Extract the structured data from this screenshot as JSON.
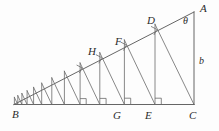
{
  "figure": {
    "background_color": "#fdfdfd",
    "stroke_color": "#555555",
    "label_color": "#2b2b2b",
    "width": 219,
    "height": 131,
    "labels": {
      "apex_left": "B",
      "right_angle_corner": "C",
      "top_right": "A",
      "angle": "θ",
      "vertical_side": "b",
      "foot_e": "E",
      "foot_g": "G",
      "point_d": "D",
      "point_f": "F",
      "point_h": "H"
    },
    "label_positions": {
      "apex_left": {
        "x": 12,
        "y": 109
      },
      "right_angle_corner": {
        "x": 189,
        "y": 110
      },
      "top_right": {
        "x": 200,
        "y": 3
      },
      "angle": {
        "x": 183,
        "y": 16
      },
      "vertical_side": {
        "x": 199,
        "y": 56
      },
      "foot_e": {
        "x": 145,
        "y": 110
      },
      "foot_g": {
        "x": 113,
        "y": 110
      },
      "point_d": {
        "x": 147,
        "y": 15
      },
      "point_f": {
        "x": 115,
        "y": 36
      },
      "point_h": {
        "x": 88,
        "y": 46
      }
    },
    "geometry": {
      "vertex_B": {
        "x": 14,
        "y": 104.5
      },
      "vertex_C": {
        "x": 194,
        "y": 104.5
      },
      "vertex_A": {
        "x": 194,
        "y": 12
      },
      "baseline_y": 104.5,
      "hypotenuse_from": "B",
      "hypotenuse_to": "A",
      "spiral_points_on_hypotenuse": [
        {
          "name": "D",
          "x": 155.0,
          "y": 24.3
        },
        {
          "name": "F",
          "x": 124.4,
          "y": 40.0
        },
        {
          "name": "H",
          "x": 99.8,
          "y": 52.7
        }
      ],
      "feet_on_baseline": [
        {
          "name": "C",
          "x": 194.0
        },
        {
          "name": "E",
          "x": 155.0
        },
        {
          "name": "G",
          "x": 124.4
        },
        {
          "name": "",
          "x": 99.8
        },
        {
          "name": "",
          "x": 80.1
        },
        {
          "name": "",
          "x": 64.4
        },
        {
          "name": "",
          "x": 51.8
        },
        {
          "name": "",
          "x": 41.7
        },
        {
          "name": "",
          "x": 33.6
        },
        {
          "name": "",
          "x": 27.1
        },
        {
          "name": "",
          "x": 21.9
        },
        {
          "name": "",
          "x": 17.8
        },
        {
          "name": "",
          "x": 14.4
        }
      ],
      "right_angle_marks_on_baseline_count": 4,
      "right_angle_marks_on_hypotenuse_count": 4
    }
  }
}
